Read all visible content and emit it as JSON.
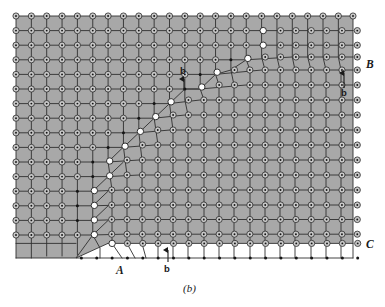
{
  "figure": {
    "caption": "(b)",
    "type": "crystal-lattice-tilt-boundary-diagram",
    "background_color": "#ffffff",
    "lattice_fill_color": "#a8a8a8",
    "unshaded_fill_color": "#ffffff",
    "line_color": "#2b2b2b",
    "open_node_fill": "#c9c9c9",
    "solid_node_fill": "#ffffff",
    "dot_color": "#151515"
  },
  "labels": [
    {
      "id": "label-A",
      "text": "A",
      "style": "italic",
      "x": 120,
      "y": 272
    },
    {
      "id": "label-B",
      "text": "B",
      "style": "italic",
      "x": 366,
      "y": 66
    },
    {
      "id": "label-C",
      "text": "C",
      "style": "italic",
      "x": 366,
      "y": 246
    },
    {
      "id": "burgers-b-bottom",
      "text": "b",
      "style": "bold",
      "x": 164,
      "y": 271
    },
    {
      "id": "burgers-b-right",
      "text": "b",
      "style": "bold",
      "x": 340,
      "y": 93
    },
    {
      "id": "burgers-b-middle",
      "text": "b",
      "style": "bold",
      "x": 180,
      "y": 73
    }
  ],
  "burgers_arrows": [
    {
      "id": "arrow-bottom",
      "x": 168,
      "y_tail": 262,
      "y_head": 249
    },
    {
      "id": "arrow-right",
      "x": 344,
      "y_tail": 88,
      "y_head": 72
    },
    {
      "id": "arrow-middle",
      "x": 184,
      "y_tail": 90,
      "y_head": 78
    }
  ],
  "chart_data": {
    "type": "diagram",
    "title": "(b)",
    "grid": {
      "cols": 23,
      "rows": 16,
      "x0": 16,
      "y0": 16,
      "dx": 15.35,
      "dy": 14.6
    },
    "boundary_nodes_x_by_row": [
      22,
      22,
      22,
      21,
      20,
      19,
      17,
      15,
      13,
      12,
      10,
      9,
      8,
      7,
      6,
      6
    ],
    "annotations": [
      "A",
      "B",
      "C",
      "b",
      "b",
      "b"
    ]
  }
}
